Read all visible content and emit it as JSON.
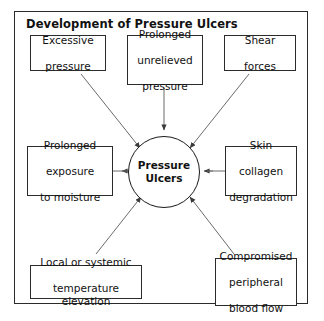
{
  "diagram": {
    "title": "Development of Pressure Ulcers",
    "center": {
      "label": "Pressure\nUlcers",
      "line1": "Pressure",
      "line2": "Ulcers"
    },
    "factors": [
      {
        "id": "excessive-pressure",
        "line1": "Excessive",
        "line2": "pressure",
        "line3": "",
        "position": "top-left"
      },
      {
        "id": "prolonged-unrelieved-pressure",
        "line1": "Prolonged",
        "line2": "unrelieved",
        "line3": "pressure",
        "position": "top-center"
      },
      {
        "id": "shear-forces",
        "line1": "Shear",
        "line2": "forces",
        "line3": "",
        "position": "top-right"
      },
      {
        "id": "prolonged-exposure-to-moisture",
        "line1": "Prolonged",
        "line2": "exposure",
        "line3": "to moisture",
        "position": "middle-left"
      },
      {
        "id": "skin-collagen-degradation",
        "line1": "Skin",
        "line2": "collagen",
        "line3": "degradation",
        "position": "middle-right"
      },
      {
        "id": "local-or-systemic-temperature-elevation",
        "line1": "Local or systemic",
        "line2": "temperature elevation",
        "line3": "",
        "position": "bottom-left"
      },
      {
        "id": "compromised-peripheral-blood-flow",
        "line1": "Compromised",
        "line2": "peripheral",
        "line3": "blood flow",
        "position": "bottom-right"
      }
    ],
    "arrow_count": 7,
    "colors": {
      "stroke": "#2b2b2b",
      "text": "#111111",
      "background": "#ffffff",
      "arrow": "#4a4a4a"
    }
  }
}
